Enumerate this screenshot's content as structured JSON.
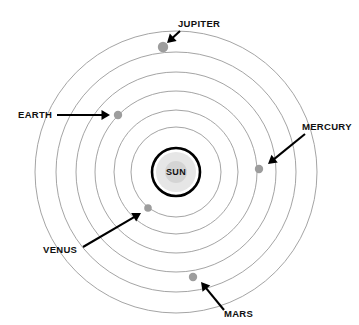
{
  "diagram": {
    "background_color": "#ffffff",
    "center": {
      "x": 176,
      "y": 172
    },
    "sun": {
      "label": "SUN",
      "outer_radius": 24,
      "mid_radius": 20,
      "core_radius": 11,
      "outer_stroke_color": "#000000",
      "mid_color": "#e6e6e6",
      "core_color": "#d4d4d4"
    },
    "orbits": [
      {
        "index": 1,
        "radius": 45,
        "stroke_color": "#9a9a9a"
      },
      {
        "index": 2,
        "radius": 62,
        "stroke_color": "#9a9a9a"
      },
      {
        "index": 3,
        "radius": 81,
        "stroke_color": "#9a9a9a"
      },
      {
        "index": 4,
        "radius": 100,
        "stroke_color": "#9a9a9a"
      },
      {
        "index": 5,
        "radius": 120,
        "stroke_color": "#9a9a9a"
      },
      {
        "index": 6,
        "radius": 141,
        "stroke_color": "#9a9a9a"
      }
    ],
    "planets": [
      {
        "id": "jupiter",
        "label": "JUPITER",
        "orbit_index": 6,
        "dot": {
          "x": 163,
          "y": 47,
          "radius": 5.2,
          "color": "#9d9d9d"
        },
        "label_pos": {
          "x": 178,
          "y": 27
        },
        "label_anchor": "start",
        "leader": {
          "x1": 180,
          "y1": 31,
          "x2": 167,
          "y2": 43
        },
        "arrow_angle_deg": 137
      },
      {
        "id": "earth",
        "label": "EARTH",
        "orbit_index": 5,
        "dot": {
          "x": 118,
          "y": 115,
          "radius": 4.2,
          "color": "#9d9d9d"
        },
        "label_pos": {
          "x": 18,
          "y": 118
        },
        "label_anchor": "start",
        "leader": {
          "x1": 57,
          "y1": 115,
          "x2": 110,
          "y2": 115
        },
        "arrow_angle_deg": 0
      },
      {
        "id": "mercury",
        "label": "MERCURY",
        "orbit_index": 4,
        "dot": {
          "x": 259,
          "y": 169,
          "radius": 4.2,
          "color": "#9d9d9d"
        },
        "label_pos": {
          "x": 302,
          "y": 130
        },
        "label_anchor": "start",
        "leader": {
          "x1": 305,
          "y1": 134,
          "x2": 268,
          "y2": 164
        },
        "arrow_angle_deg": 141
      },
      {
        "id": "venus",
        "label": "VENUS",
        "orbit_index": 3,
        "dot": {
          "x": 148,
          "y": 208,
          "radius": 3.8,
          "color": "#9d9d9d"
        },
        "label_pos": {
          "x": 43,
          "y": 253
        },
        "label_anchor": "start",
        "leader": {
          "x1": 83,
          "y1": 247,
          "x2": 141,
          "y2": 213
        },
        "arrow_angle_deg": -30
      },
      {
        "id": "mars",
        "label": "MARS",
        "orbit_index": 5,
        "dot": {
          "x": 193,
          "y": 277,
          "radius": 4.2,
          "color": "#9d9d9d"
        },
        "label_pos": {
          "x": 224,
          "y": 317
        },
        "label_anchor": "start",
        "leader": {
          "x1": 224,
          "y1": 310,
          "x2": 201,
          "y2": 282
        },
        "arrow_angle_deg": -130
      }
    ]
  }
}
